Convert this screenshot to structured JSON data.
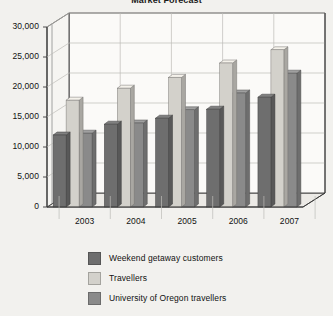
{
  "chart_data": {
    "type": "bar",
    "title": "Market Forecast",
    "xlabel": "",
    "ylabel": "",
    "categories": [
      "2003",
      "2004",
      "2005",
      "2006",
      "2007"
    ],
    "series": [
      {
        "name": "Weekend getaway customers",
        "color": "#6e6e6e",
        "values": [
          12000,
          13800,
          14800,
          16300,
          18300
        ]
      },
      {
        "name": "Travellers",
        "color": "#d3d1cb",
        "values": [
          17800,
          19800,
          21600,
          24000,
          26200
        ]
      },
      {
        "name": "University of Oregon travellers",
        "color": "#8a8a8a",
        "values": [
          12300,
          14000,
          16200,
          19000,
          22300
        ]
      }
    ],
    "ylim": [
      0,
      30000
    ],
    "yticks": [
      0,
      5000,
      10000,
      15000,
      20000,
      25000,
      30000
    ],
    "ytick_labels": [
      "0",
      "5,000",
      "10,000",
      "15,000",
      "20,000",
      "25,000",
      "30,000"
    ],
    "grid": true,
    "legend_position": "bottom",
    "three_d": true,
    "background_color": "#f2f1ee",
    "axis_color": "#3a3a3a",
    "grid_color": "#bdbcb8"
  }
}
